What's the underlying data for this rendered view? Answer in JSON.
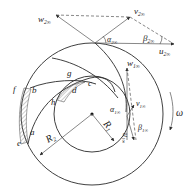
{
  "diagram": {
    "colors": {
      "stroke": "#2a2a2a",
      "hatch": "#555555",
      "background": "#ffffff"
    },
    "points": {
      "a": "a",
      "b": "b",
      "c": "c",
      "d": "d",
      "e": "e",
      "f": "f",
      "g": "g",
      "h": "h"
    },
    "radii": {
      "R1": {
        "main": "R",
        "sub": "1"
      },
      "R2": {
        "main": "R",
        "sub": "2"
      }
    },
    "outlet_triangle": {
      "w2": {
        "main": "w",
        "sub": "2∞"
      },
      "v2": {
        "main": "v",
        "sub": "2∞"
      },
      "u2": {
        "main": "u",
        "sub": "2∞"
      },
      "alpha2": {
        "main": "α",
        "sub": "2∞"
      },
      "beta2": {
        "main": "β",
        "sub": "2∞"
      }
    },
    "inlet_triangle": {
      "w1": {
        "main": "w",
        "sub": "1∞"
      },
      "v1": {
        "main": "v",
        "sub": "1∞"
      },
      "u1": {
        "main": "u",
        "sub": "1∞"
      },
      "alpha1": {
        "main": "α",
        "sub": "1∞"
      },
      "beta1": {
        "main": "β",
        "sub": "1∞"
      }
    },
    "rotation": {
      "label": "ω"
    }
  }
}
